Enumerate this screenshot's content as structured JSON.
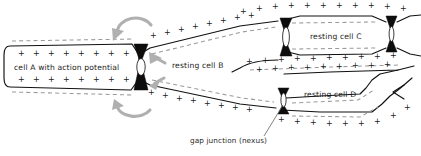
{
  "figure": {
    "width": 421,
    "height": 156,
    "background_color": "#ffffff"
  },
  "cells": [
    {
      "id": "cell-a",
      "label": "cell A with action potential",
      "label_x": 70,
      "label_y": 68,
      "state": "depolarized",
      "inside_charge": "+",
      "outside_charge": "-"
    },
    {
      "id": "cell-b",
      "label": "resting cell B",
      "label_x": 199,
      "label_y": 66,
      "state": "resting",
      "inside_charge": "-",
      "outside_charge": "+"
    },
    {
      "id": "cell-c",
      "label": "resting cell C",
      "label_x": 340,
      "label_y": 37,
      "state": "resting",
      "inside_charge": "-",
      "outside_charge": "+"
    },
    {
      "id": "cell-d",
      "label": "resting cell D",
      "label_x": 340,
      "label_y": 95,
      "state": "resting",
      "inside_charge": "-",
      "outside_charge": "+"
    }
  ],
  "callout": {
    "label": "gap junction (nexus)",
    "label_x": 200,
    "label_y": 142,
    "leader_from_x": 264,
    "leader_from_y": 136,
    "leader_to_x": 283,
    "leader_to_y": 105
  },
  "junctions": [
    {
      "id": "junction-a-b",
      "cx": 141,
      "cy": 67,
      "between": "cell A / cell B"
    },
    {
      "id": "junction-b-c",
      "cx": 285,
      "cy": 38,
      "between": "cell B / cell C"
    },
    {
      "id": "junction-c-right",
      "cx": 392,
      "cy": 35,
      "between": "cell C / next cell"
    },
    {
      "id": "junction-b-d",
      "cx": 283,
      "cy": 103,
      "between": "cell B / cell D"
    }
  ],
  "current_arrows": [
    {
      "id": "arrow-top",
      "direction": "counterclockwise",
      "description": "local current loop above junction A-B"
    },
    {
      "id": "arrow-bottom",
      "direction": "clockwise",
      "description": "local current loop below junction A-B"
    },
    {
      "id": "arrow-inner-upper",
      "direction": "into-cell-b-upper",
      "description": "current entering cell B upper"
    },
    {
      "id": "arrow-inner-lower",
      "direction": "into-cell-b-lower",
      "description": "current entering cell B lower"
    }
  ],
  "colors": {
    "membrane": "#111111",
    "dashed_charge_line": "#9a9a9a",
    "junction": "#0d0d0d",
    "arrow": "#b0b0b0",
    "text": "#1a1a1a"
  },
  "charge_rows": {
    "cell_a_inside_top": {
      "count": 8,
      "symbol": "+",
      "x_start": 18,
      "x_step": 15,
      "y": 53
    },
    "cell_a_inside_bottom": {
      "count": 8,
      "symbol": "+",
      "x_start": 18,
      "x_step": 15,
      "y": 83
    },
    "cell_b_outside_top": {
      "count": 9,
      "symbol": "+",
      "x_start": 150,
      "x_step": 14,
      "y": 33
    },
    "cell_b_outside_bottom": {
      "count": 9,
      "symbol": "+",
      "x_start": 148,
      "x_step": 14,
      "y": 100
    },
    "cell_c_outside_top": {
      "count": 11,
      "symbol": "+",
      "x_start": 238,
      "x_step": 16,
      "y": 10
    },
    "cell_c_outside_bottom": {
      "count": 10,
      "symbol": "+",
      "x_start": 246,
      "x_step": 16,
      "y": 60
    },
    "cell_d_outside_bottom": {
      "count": 9,
      "symbol": "+",
      "x_start": 272,
      "x_step": 15,
      "y": 120
    }
  }
}
